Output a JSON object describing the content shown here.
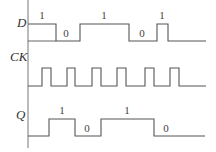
{
  "diagram": {
    "type": "timing-diagram",
    "axis": {
      "x": 28,
      "y_top": 0,
      "y_bottom": 148
    },
    "signals": [
      {
        "name": "D",
        "label_pos": [
          17,
          27
        ],
        "high_y": 24,
        "low_y": 41,
        "x_end": 206,
        "pulses": [
          [
            28,
            56
          ],
          [
            80,
            129
          ],
          [
            157,
            168
          ]
        ],
        "level_labels": [
          {
            "text": "1",
            "x": 42,
            "y": 19
          },
          {
            "text": "0",
            "x": 66,
            "y": 37
          },
          {
            "text": "1",
            "x": 104,
            "y": 19
          },
          {
            "text": "0",
            "x": 142,
            "y": 37
          },
          {
            "text": "1",
            "x": 162,
            "y": 19
          }
        ]
      },
      {
        "name": "CK",
        "label_pos": [
          10,
          61
        ],
        "high_y": 68,
        "low_y": 86,
        "x_end": 206,
        "pulses": [
          [
            42,
            51
          ],
          [
            67,
            75
          ],
          [
            92,
            101
          ],
          [
            117,
            126
          ],
          [
            145,
            154
          ],
          [
            170,
            179
          ]
        ],
        "level_labels": []
      },
      {
        "name": "Q",
        "label_pos": [
          16,
          119
        ],
        "high_y": 119,
        "low_y": 136,
        "x_end": 205,
        "pulses": [
          [
            49,
            75
          ],
          [
            101,
            154
          ]
        ],
        "level_labels": [
          {
            "text": "1",
            "x": 62,
            "y": 114
          },
          {
            "text": "0",
            "x": 87,
            "y": 132
          },
          {
            "text": "1",
            "x": 127,
            "y": 114
          },
          {
            "text": "0",
            "x": 166,
            "y": 132
          }
        ]
      }
    ]
  }
}
